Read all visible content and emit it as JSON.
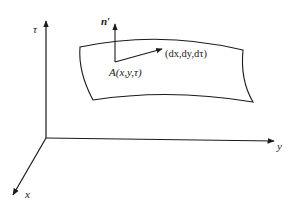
{
  "diagram": {
    "axes": {
      "tau": {
        "label": "τ"
      },
      "y": {
        "label": "y"
      },
      "x": {
        "label": "x"
      }
    },
    "surface": {
      "point_label": "A(x,y,τ)",
      "normal_label": "n′",
      "tangent_label": "(dx,dy,dτ)"
    },
    "colors": {
      "stroke": "#1a1a1a",
      "background": "#ffffff"
    }
  }
}
